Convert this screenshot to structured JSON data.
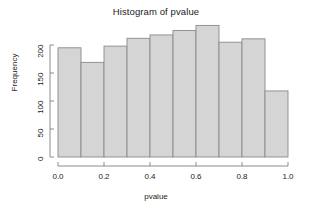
{
  "chart_data": {
    "type": "bar",
    "title": "Histogram of pvalue",
    "xlabel": "pvalue",
    "ylabel": "Frequency",
    "categories": [
      "0.0-0.1",
      "0.1-0.2",
      "0.2-0.3",
      "0.3-0.4",
      "0.4-0.5",
      "0.5-0.6",
      "0.6-0.7",
      "0.7-0.8",
      "0.8-0.9",
      "0.9-1.0"
    ],
    "bin_edges": [
      0.0,
      0.1,
      0.2,
      0.3,
      0.4,
      0.5,
      0.6,
      0.7,
      0.8,
      0.9,
      1.0
    ],
    "values": [
      195,
      169,
      198,
      212,
      218,
      226,
      235,
      205,
      211,
      118
    ],
    "xlim": [
      0.0,
      1.0
    ],
    "ylim": [
      0,
      235
    ],
    "xticks": [
      0.0,
      0.2,
      0.4,
      0.6,
      0.8,
      1.0
    ],
    "xtick_labels": [
      "0.0",
      "0.2",
      "0.4",
      "0.6",
      "0.8",
      "1.0"
    ],
    "yticks": [
      0,
      50,
      100,
      150,
      200
    ],
    "ytick_labels": [
      "0",
      "50",
      "100",
      "150",
      "200"
    ],
    "grid": false,
    "legend": null,
    "bar_fill_color": "#d5d5d5",
    "bar_border_color": "#8a8a8a",
    "axis_color": "#808080",
    "text_color": "#1a1a1a"
  }
}
